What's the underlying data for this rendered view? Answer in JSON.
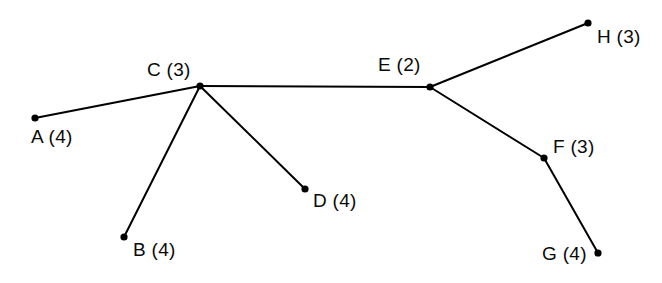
{
  "diagram": {
    "type": "graph-tree",
    "title": "",
    "background_color": "#ffffff",
    "stroke_color": "#000000",
    "node_color": "#000000",
    "edge_width": 2,
    "node_radius": 3.6,
    "canvas": {
      "width": 662,
      "height": 283
    },
    "nodes": [
      {
        "id": "A",
        "label": "A (4)",
        "name": "A",
        "value": "4",
        "x": 35,
        "y": 118,
        "label_x": 31,
        "label_y": 127,
        "label_align": "left"
      },
      {
        "id": "B",
        "label": "B (4)",
        "name": "B",
        "value": "4",
        "x": 124,
        "y": 237,
        "label_x": 133,
        "label_y": 240,
        "label_align": "left"
      },
      {
        "id": "C",
        "label": "C (3)",
        "name": "C",
        "value": "3",
        "x": 200,
        "y": 86,
        "label_x": 147,
        "label_y": 60,
        "label_align": "left"
      },
      {
        "id": "D",
        "label": "D (4)",
        "name": "D",
        "value": "4",
        "x": 305,
        "y": 189,
        "label_x": 313,
        "label_y": 191,
        "label_align": "left"
      },
      {
        "id": "E",
        "label": "E (2)",
        "name": "E",
        "value": "2",
        "x": 430,
        "y": 87,
        "label_x": 378,
        "label_y": 55,
        "label_align": "left"
      },
      {
        "id": "F",
        "label": "F (3)",
        "name": "F",
        "value": "3",
        "x": 544,
        "y": 158,
        "label_x": 553,
        "label_y": 137,
        "label_align": "left"
      },
      {
        "id": "G",
        "label": "G (4)",
        "name": "G",
        "value": "4",
        "x": 598,
        "y": 253,
        "label_x": 542,
        "label_y": 244,
        "label_align": "left"
      },
      {
        "id": "H",
        "label": "H (3)",
        "name": "H",
        "value": "3",
        "x": 588,
        "y": 23,
        "label_x": 597,
        "label_y": 27,
        "label_align": "left"
      }
    ],
    "edges": [
      {
        "from": "A",
        "to": "C"
      },
      {
        "from": "B",
        "to": "C"
      },
      {
        "from": "C",
        "to": "D"
      },
      {
        "from": "C",
        "to": "E"
      },
      {
        "from": "E",
        "to": "H"
      },
      {
        "from": "E",
        "to": "F"
      },
      {
        "from": "F",
        "to": "G"
      }
    ]
  }
}
